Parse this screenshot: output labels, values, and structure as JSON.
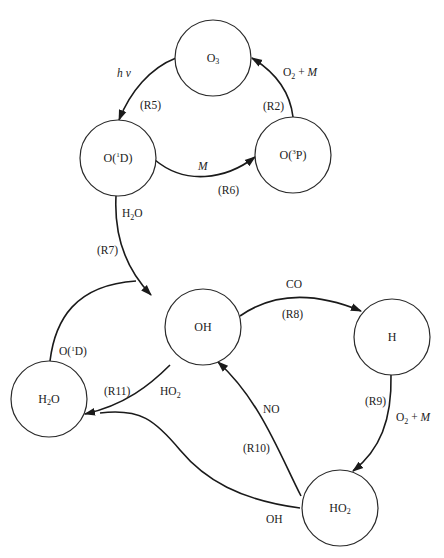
{
  "diagram": {
    "type": "reaction-cycle",
    "nodes": [
      {
        "id": "O3",
        "label": "O",
        "sub": "3",
        "cx": 213,
        "cy": 58
      },
      {
        "id": "O1D",
        "label_pre": "O(",
        "sup": "1",
        "label_post": "D)",
        "cx": 118,
        "cy": 158
      },
      {
        "id": "O3P",
        "label_pre": "O(",
        "sup": "3",
        "label_post": "P)",
        "cx": 293,
        "cy": 155
      },
      {
        "id": "OH",
        "label": "OH",
        "cx": 203,
        "cy": 327
      },
      {
        "id": "H",
        "label": "H",
        "cx": 392,
        "cy": 337
      },
      {
        "id": "H2O",
        "label_pre": "H",
        "sub": "2",
        "label_post": "O",
        "cx": 49,
        "cy": 399
      },
      {
        "id": "HO2",
        "label": "HO",
        "sub": "2",
        "cx": 340,
        "cy": 508
      }
    ],
    "edges": [
      {
        "id": "R5",
        "from": "O3",
        "to": "O1D",
        "reaction": "(R5)",
        "reagent": "h ν"
      },
      {
        "id": "R6",
        "from": "O1D",
        "to": "O3P",
        "reaction": "(R6)",
        "reagent": "M"
      },
      {
        "id": "R2",
        "from": "O3P",
        "to": "O3",
        "reaction": "(R2)",
        "reagent_pre": "O",
        "reagent_sub": "2",
        "reagent_post": " + ",
        "reagent_italic": "M"
      },
      {
        "id": "R7",
        "from": "O1D",
        "to": "OH",
        "reaction": "(R7)",
        "reagent_pre": "H",
        "reagent_sub": "2",
        "reagent_post": "O"
      },
      {
        "id": "R8",
        "from": "OH",
        "to": "H",
        "reaction": "(R8)",
        "reagent": "CO"
      },
      {
        "id": "R9",
        "from": "H",
        "to": "HO2",
        "reaction": "(R9)",
        "reagent_pre": "O",
        "reagent_sub": "2",
        "reagent_post": " + ",
        "reagent_italic": "M"
      },
      {
        "id": "R10",
        "from": "HO2",
        "to": "OH",
        "reaction": "(R10)",
        "reagent": "NO"
      },
      {
        "id": "R11a",
        "from": "OH",
        "to": "H2O",
        "reaction": "(R11)",
        "reagent_pre": "HO",
        "reagent_sub": "2"
      },
      {
        "id": "R11b",
        "from": "HO2",
        "to": "H2O",
        "reagent": "OH"
      },
      {
        "id": "H2O-O1D",
        "from": "H2O",
        "to": "OH",
        "reagent_pre": "O(",
        "reagent_sup": "1",
        "reagent_post": "D)"
      }
    ]
  },
  "labels": {
    "o3": {
      "main": "O",
      "sub": "3"
    },
    "o1d": {
      "pre": "O(",
      "sup": "1",
      "post": "D)"
    },
    "o3p": {
      "pre": "O(",
      "sup": "3",
      "post": "P)"
    },
    "oh": {
      "main": "OH"
    },
    "h": {
      "main": "H"
    },
    "h2o": {
      "pre": "H",
      "sub": "2",
      "post": "O"
    },
    "ho2": {
      "main": "HO",
      "sub": "2"
    },
    "r5": {
      "reaction": "(R5)",
      "reagent": "h ν"
    },
    "r6": {
      "reaction": "(R6)",
      "reagent": "M"
    },
    "r2": {
      "reaction": "(R2)",
      "pre": "O",
      "sub": "2",
      "mid": " + ",
      "it": "M"
    },
    "r7": {
      "reaction": "(R7)",
      "pre": "H",
      "sub": "2",
      "post": "O"
    },
    "r8": {
      "reaction": "(R8)",
      "reagent": "CO"
    },
    "r9": {
      "reaction": "(R9)",
      "pre": "O",
      "sub": "2",
      "mid": " + ",
      "it": "M"
    },
    "r10": {
      "reaction": "(R10)",
      "reagent": "NO"
    },
    "r11": {
      "reaction": "(R11)",
      "pre": "HO",
      "sub": "2"
    },
    "r11b": {
      "reagent": "OH"
    },
    "h2o_o1d": {
      "pre": "O(",
      "sup": "1",
      "post": "D)"
    }
  }
}
